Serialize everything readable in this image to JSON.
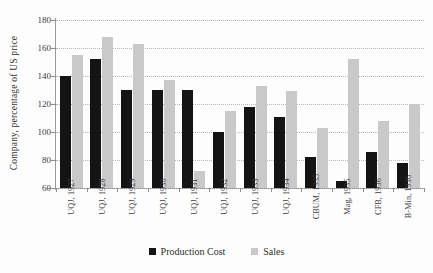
{
  "chart_data": {
    "type": "bar",
    "title": "",
    "xlabel": "",
    "ylabel": "Company, percentage of US price",
    "ylim": [
      60,
      180
    ],
    "ytick_step": 20,
    "yticks": [
      60,
      80,
      100,
      120,
      140,
      160,
      180
    ],
    "grid": true,
    "legend_position": "bottom",
    "categories": [
      "UQJ, 1927",
      "UQJ, 1928",
      "UQJ, 1929",
      "UQJ, 1930",
      "UQJ, 1931",
      "UQJ, 1932",
      "UQJ, 1933",
      "UQJ, 1934",
      "CBUM, 1935",
      "Mag, 1935",
      "CFB, 1936",
      "B-Min, 1936"
    ],
    "series": [
      {
        "name": "Production Cost",
        "color": "#141414",
        "values": [
          140,
          152,
          130,
          130,
          130,
          100,
          118,
          111,
          82,
          65,
          86,
          78
        ]
      },
      {
        "name": "Sales",
        "color": "#c9c9c9",
        "values": [
          155,
          168,
          163,
          137,
          72,
          115,
          133,
          129,
          103,
          152,
          108,
          120
        ]
      }
    ]
  },
  "legend": {
    "items": [
      {
        "label": "Production Cost"
      },
      {
        "label": "Sales"
      }
    ]
  }
}
